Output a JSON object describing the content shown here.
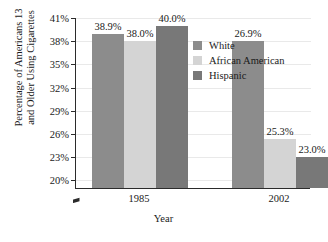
{
  "chart_data": {
    "type": "bar",
    "title": "",
    "xlabel": "Year",
    "ylabel_line1": "Percentage of Americans 13",
    "ylabel_line2": "and Older Using Cigarettes",
    "categories": [
      "1985",
      "2002"
    ],
    "series": [
      {
        "name": "White",
        "color": "#8c8c8c",
        "values": [
          38.9,
          38.0
        ],
        "labels": [
          "38.9%",
          "26.9%"
        ]
      },
      {
        "name": "African American",
        "color": "#d4d4d4",
        "values": [
          38.0,
          25.3
        ],
        "labels": [
          "38.0%",
          "25.3%"
        ]
      },
      {
        "name": "Hispanic",
        "color": "#787878",
        "values": [
          40.0,
          23.0
        ],
        "labels": [
          "40.0%",
          "23.0%"
        ]
      }
    ],
    "ylim": [
      19.0,
      41.0
    ],
    "yticks": [
      20,
      23,
      26,
      29,
      32,
      35,
      38,
      41
    ],
    "ytick_labels": [
      "20%",
      "23%",
      "26%",
      "29%",
      "32%",
      "35%",
      "38%",
      "41%"
    ],
    "axis_break": true,
    "grid": true,
    "legend_position": "inside-top-right"
  },
  "legend": {
    "items": [
      {
        "label": "White",
        "swatch": "legend-swatch-white"
      },
      {
        "label": "African American",
        "swatch": "legend-swatch-african-american"
      },
      {
        "label": "Hispanic",
        "swatch": "legend-swatch-hispanic"
      }
    ]
  }
}
